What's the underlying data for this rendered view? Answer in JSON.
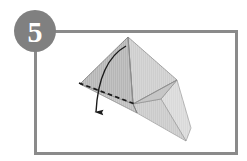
{
  "figure": {
    "kind": "origami-instruction-step",
    "step_label": "5",
    "caption": ""
  },
  "badge": {
    "label": "5",
    "shape": "circle",
    "fill_color": "#808080",
    "text_color": "#ffffff",
    "center_x": 35,
    "center_y": 31,
    "radius": 21
  },
  "frame": {
    "name": "panel-border",
    "x": 34,
    "y": 30,
    "width": 204,
    "height": 125,
    "stroke_color": "#8a8a8a",
    "stroke_width": 3,
    "fill_color": "#ffffff"
  },
  "colors": {
    "paper_front": "#b9b9b9",
    "paper_mid": "#c4c4c4",
    "paper_light": "#d2d2d2",
    "paper_lighter": "#dcdcdc",
    "paper_shadow": "#aaaaaa",
    "edge_line": "#6e6e6e",
    "fold_dashed": "#1a1a1a",
    "arrow": "#1a1a1a",
    "frame_gray": "#8a8a8a",
    "badge_gray": "#808080",
    "background": "#ffffff"
  },
  "shape": {
    "name": "folded-paper-model",
    "vertices": {
      "apex": [
        128,
        37
      ],
      "left": [
        80,
        84
      ],
      "center_bottom": [
        133,
        104
      ],
      "right": [
        177,
        80
      ],
      "lower_tip": [
        185,
        141
      ],
      "left_bottom_tip": [
        136,
        112
      ],
      "inner_right": [
        160,
        100
      ]
    },
    "panels": [
      {
        "name": "left-upper-panel",
        "points": "128,37 80,84 133,104",
        "fill": "#b9b9b9"
      },
      {
        "name": "right-upper-panel",
        "points": "128,37 177,80 133,104",
        "fill": "#cdcdcd"
      },
      {
        "name": "left-lower-panel",
        "points": "80,84 133,104 136,112",
        "fill": "#c2c2c2"
      },
      {
        "name": "right-lower-flap",
        "points": "177,80 160,100 185,141",
        "fill": "#d7d7d7"
      },
      {
        "name": "inner-flap",
        "points": "133,104 160,100 185,141 136,112",
        "fill": "#cfcfcf"
      }
    ]
  },
  "annotations": {
    "fold_line": {
      "name": "valley-fold-dashed-line",
      "from": [
        80,
        84
      ],
      "to": [
        134,
        104
      ],
      "style": "dashed",
      "color": "#1a1a1a"
    },
    "arrow": {
      "name": "fold-direction-arrow",
      "start": [
        126,
        46
      ],
      "end": [
        97,
        113
      ],
      "head_point": [
        95,
        121
      ],
      "style": "curved-solid",
      "color": "#1a1a1a",
      "direction": "down-left"
    }
  }
}
